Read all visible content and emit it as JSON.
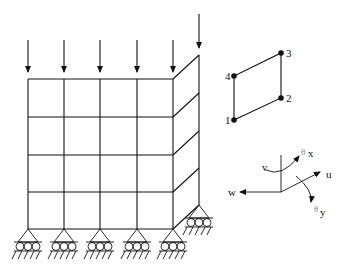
{
  "figure": {
    "mesh": {
      "columns_x": [
        28,
        64,
        100,
        137,
        173
      ],
      "rows_y": [
        79,
        117,
        155,
        192,
        229
      ],
      "side_face_offset": {
        "dx": 26,
        "dy": -24
      },
      "side_face_top": [
        199,
        55
      ],
      "side_face_bottom": [
        199,
        205
      ]
    },
    "loads": {
      "count": 6,
      "label": "vertical point loads",
      "positions_x": [
        28,
        64,
        100,
        137,
        173,
        199
      ]
    },
    "supports": {
      "count": 6,
      "type": "roller support",
      "positions": [
        [
          28,
          229
        ],
        [
          64,
          229
        ],
        [
          100,
          229
        ],
        [
          137,
          229
        ],
        [
          173,
          229
        ],
        [
          199,
          205
        ]
      ]
    },
    "element": {
      "nodes": [
        {
          "id": "1",
          "label": "1",
          "x": 234,
          "y": 120
        },
        {
          "id": "2",
          "label": "2",
          "x": 281,
          "y": 98
        },
        {
          "id": "3",
          "label": "3",
          "x": 281,
          "y": 53
        },
        {
          "id": "4",
          "label": "4",
          "x": 234,
          "y": 76
        }
      ]
    },
    "dof_axes": {
      "u": "u",
      "v": "v",
      "w": "w",
      "theta_x": "θ",
      "theta_x_sub": "x",
      "theta_y": "θ",
      "theta_y_sub": "y"
    }
  }
}
